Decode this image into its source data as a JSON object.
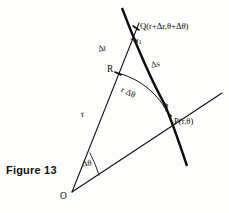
{
  "figure": {
    "caption": "Figure 13",
    "background_color": "#fdfdfb",
    "ink_color": "#0d0d0d",
    "points": {
      "O": {
        "label": "O",
        "x": 72,
        "y": 192
      },
      "P": {
        "label": "P(r,θ)",
        "x": 170,
        "y": 116
      },
      "Q": {
        "label": "Q(r+Δr,θ+Δθ)",
        "x": 136,
        "y": 28
      },
      "R": {
        "label": "R",
        "x": 118,
        "y": 73
      }
    },
    "segment_labels": {
      "delta_r": "Δr",
      "delta_s": "Δs",
      "radius": "r",
      "arc": "r Δθ",
      "delta_theta": "Δθ"
    },
    "angle_labels": {
      "psi_one": "ψ",
      "psi_one_sub": "1",
      "psi": "ψ"
    },
    "label_list": [
      "Q(r+Δr,θ+Δθ)",
      "P(r,θ)",
      "R",
      "O",
      "Δr",
      "Δs",
      "r",
      "r Δθ",
      "ψ₁",
      "ψ",
      "Δθ",
      "Figure 13"
    ]
  }
}
